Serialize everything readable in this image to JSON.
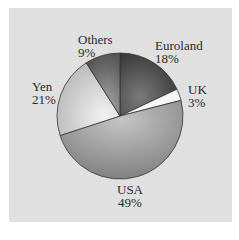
{
  "chart_data": {
    "type": "pie",
    "title": "",
    "categories": [
      "Euroland",
      "UK",
      "USA",
      "Yen",
      "Others"
    ],
    "values": [
      18,
      3,
      49,
      21,
      9
    ],
    "labels": [
      "18%",
      "3%",
      "49%",
      "21%",
      "9%"
    ],
    "start_angle": "12 o'clock",
    "direction": "clockwise",
    "colors": [
      "#4a4a4a",
      "#f4f4f4",
      "#9a9a9a",
      "#cfcfcf",
      "#6e6e6e"
    ],
    "legend": "none (direct labels)"
  },
  "labels": {
    "euroland": {
      "name": "Euroland",
      "pct": "18%"
    },
    "uk": {
      "name": "UK",
      "pct": "3%"
    },
    "usa": {
      "name": "USA",
      "pct": "49%"
    },
    "yen": {
      "name": "Yen",
      "pct": "21%"
    },
    "others": {
      "name": "Others",
      "pct": "9%"
    }
  },
  "colors": {
    "background": "#e0e0e0",
    "border": "#ffffff"
  }
}
